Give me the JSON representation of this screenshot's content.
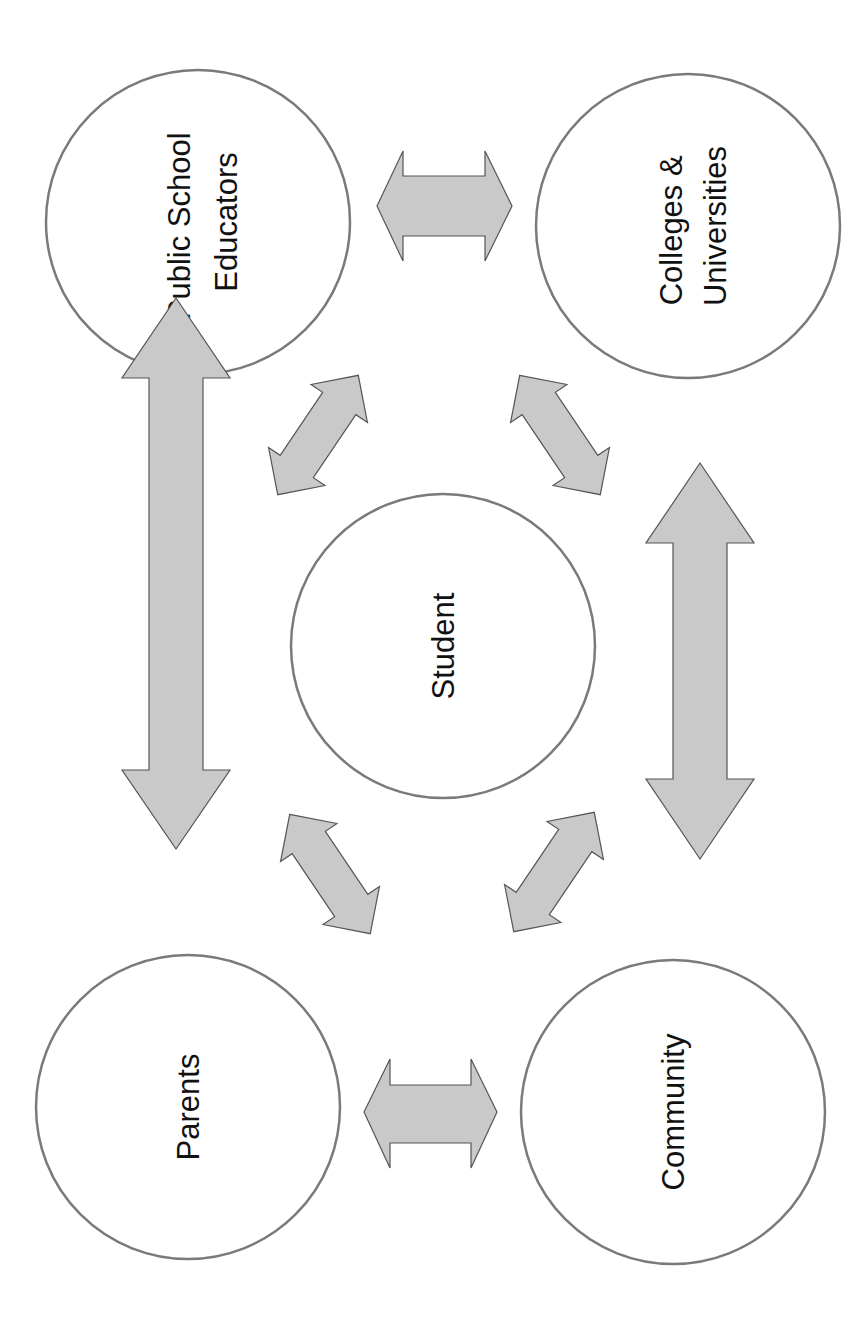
{
  "diagram": {
    "type": "relationship-diagram",
    "orientation": "rotated-90-ccw",
    "colors": {
      "background": "#ffffff",
      "circle_stroke": "#7a7a7a",
      "arrow_fill": "#c9c9c9",
      "arrow_stroke": "#555555",
      "text": "#111111"
    },
    "nodes": {
      "center": {
        "label_lines": [
          "Student"
        ]
      },
      "public_school_educators": {
        "label_lines": [
          "Public School",
          "Educators"
        ]
      },
      "colleges_universities": {
        "label_lines": [
          "Colleges &",
          "Universities"
        ]
      },
      "parents": {
        "label_lines": [
          "Parents"
        ]
      },
      "community": {
        "label_lines": [
          "Community"
        ]
      }
    },
    "connections": [
      {
        "from": "Public School Educators",
        "to": "Colleges & Universities",
        "type": "bidirectional"
      },
      {
        "from": "Parents",
        "to": "Community",
        "type": "bidirectional"
      },
      {
        "from": "Public School Educators",
        "to": "Parents",
        "type": "bidirectional"
      },
      {
        "from": "Colleges & Universities",
        "to": "Community",
        "type": "bidirectional"
      },
      {
        "from": "Student",
        "to": "Public School Educators",
        "type": "bidirectional"
      },
      {
        "from": "Student",
        "to": "Colleges & Universities",
        "type": "bidirectional"
      },
      {
        "from": "Student",
        "to": "Parents",
        "type": "bidirectional"
      },
      {
        "from": "Student",
        "to": "Community",
        "type": "bidirectional"
      }
    ]
  }
}
